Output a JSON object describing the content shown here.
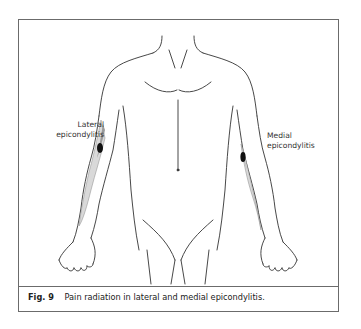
{
  "figure": {
    "labels": {
      "lateral_line1": "Lateral",
      "lateral_line2": "epicondylitis",
      "medial_line1": "Medial",
      "medial_line2": "epicondylitis"
    },
    "caption": {
      "number": "Fig. 9",
      "text": "Pain radiation in lateral and medial epicondylitis."
    },
    "colors": {
      "outline": "#333333",
      "frame": "#6b6b6b",
      "shading_light": "#d9d9d9",
      "shading_mid": "#9a9a9a",
      "focus": "#111111"
    }
  }
}
